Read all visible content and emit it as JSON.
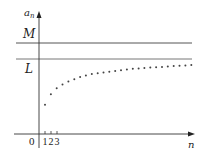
{
  "figure": {
    "y_axis_label_main": "a",
    "y_axis_label_sub": "n",
    "x_axis_label": "n",
    "origin_label": "0",
    "upper_bound_label": "M",
    "limit_label": "L",
    "ticks": [
      "1",
      "2",
      "3"
    ]
  },
  "chart_data": {
    "type": "scatter",
    "title": "",
    "xlabel": "n",
    "ylabel": "a_n",
    "horizontal_lines": [
      {
        "name": "M",
        "role": "upper bound"
      },
      {
        "name": "L",
        "role": "limit"
      }
    ],
    "x_ticks": [
      1,
      2,
      3
    ],
    "grid": false,
    "legend": "none",
    "series": [
      {
        "name": "a_n",
        "x": [
          1,
          2,
          3,
          4,
          5,
          6,
          7,
          8,
          9,
          10,
          11,
          12,
          13,
          14,
          15,
          16,
          17,
          18,
          19,
          20,
          21,
          22,
          23,
          24,
          25,
          26
        ],
        "y_relative_to_L": [
          0.57,
          0.43,
          0.35,
          0.3,
          0.26,
          0.23,
          0.2,
          0.18,
          0.16,
          0.15,
          0.14,
          0.13,
          0.12,
          0.11,
          0.1,
          0.09,
          0.085,
          0.08,
          0.075,
          0.07,
          0.065,
          0.06,
          0.055,
          0.05,
          0.045,
          0.04
        ]
      }
    ]
  },
  "colors": {
    "axis": "#333333",
    "line": "#555555",
    "dots": "#444444"
  }
}
